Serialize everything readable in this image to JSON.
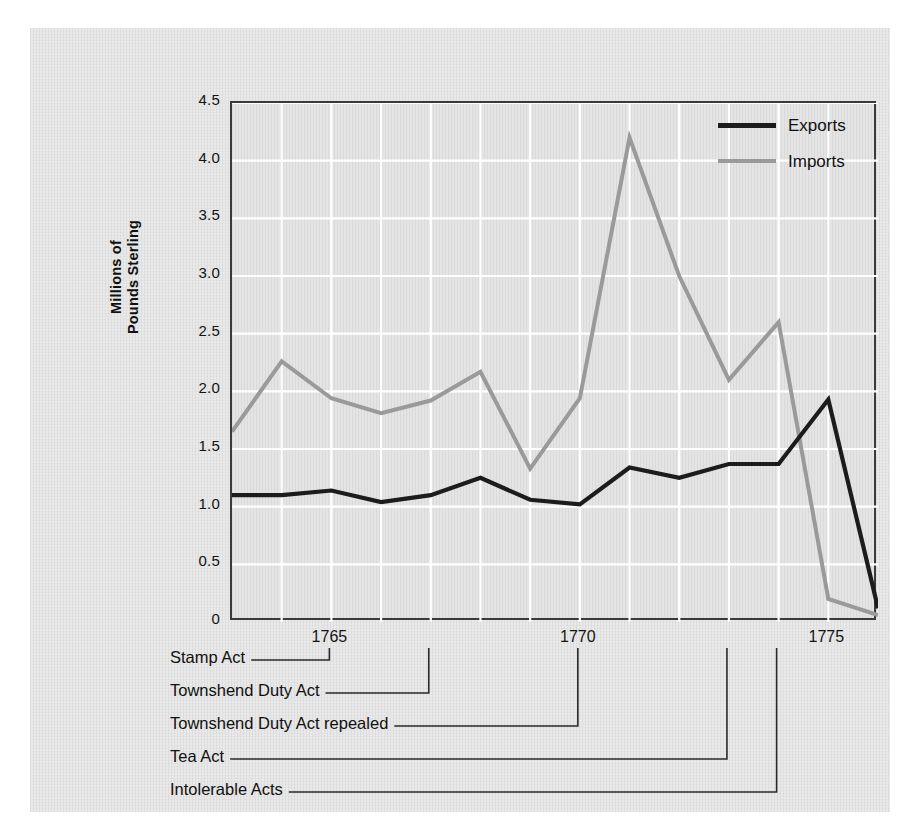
{
  "chart_data": {
    "type": "line",
    "title": "",
    "xlabel": "",
    "ylabel": "Millions of Pounds Sterling",
    "xlim": [
      1763,
      1776
    ],
    "ylim": [
      0,
      4.5
    ],
    "grid": true,
    "legend_position": "top-right",
    "x": [
      1763,
      1764,
      1765,
      1766,
      1767,
      1768,
      1769,
      1770,
      1771,
      1772,
      1773,
      1774,
      1775,
      1776
    ],
    "series": [
      {
        "name": "Exports",
        "color": "#1c1c1c",
        "values": [
          1.1,
          1.1,
          1.14,
          1.04,
          1.1,
          1.25,
          1.06,
          1.02,
          1.34,
          1.25,
          1.37,
          1.37,
          1.93,
          0.12
        ]
      },
      {
        "name": "Imports",
        "color": "#9a9a9a",
        "values": [
          1.65,
          2.26,
          1.94,
          1.81,
          1.92,
          2.17,
          1.33,
          1.94,
          4.2,
          3.0,
          2.1,
          2.6,
          0.2,
          0.06
        ]
      }
    ],
    "y_ticks": [
      "0",
      "0.5",
      "1.0",
      "1.5",
      "2.0",
      "2.5",
      "3.0",
      "3.5",
      "4.0",
      "4.5"
    ],
    "y_tick_values": [
      0,
      0.5,
      1.0,
      1.5,
      2.0,
      2.5,
      3.0,
      3.5,
      4.0,
      4.5
    ],
    "x_ticks": [
      "1765",
      "1770",
      "1775"
    ],
    "x_tick_values": [
      1765,
      1770,
      1775
    ],
    "annotations": [
      {
        "label": "Stamp Act",
        "year": 1765
      },
      {
        "label": "Townshend Duty Act",
        "year": 1767
      },
      {
        "label": "Townshend Duty Act repealed",
        "year": 1770
      },
      {
        "label": "Tea Act",
        "year": 1773
      },
      {
        "label": "Intolerable Acts",
        "year": 1774
      }
    ]
  },
  "axis": {
    "y_title_line1": "Millions of",
    "y_title_line2": "Pounds Sterling"
  },
  "legend": {
    "items": [
      {
        "label": "Exports",
        "color": "#1c1c1c"
      },
      {
        "label": "Imports",
        "color": "#9a9a9a"
      }
    ]
  }
}
